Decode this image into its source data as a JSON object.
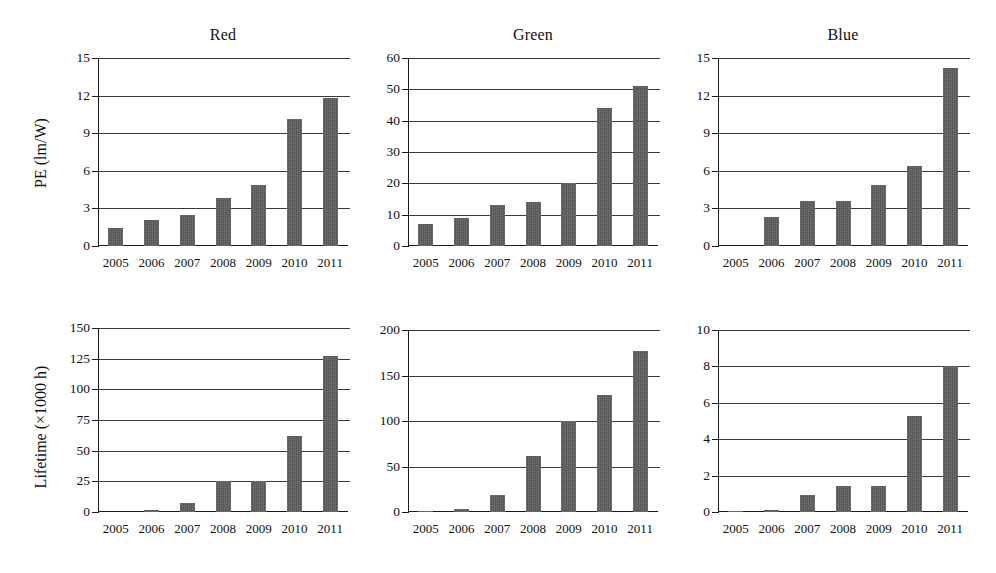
{
  "figure": {
    "width": 996,
    "height": 573,
    "bar_color": "#5c5c5c",
    "axis_color": "#1b1b1b",
    "grid_color": "#3a3a3a",
    "background": "#ffffff"
  },
  "axis_labels": {
    "pe": "PE (lm/W)",
    "lifetime": "Lifetime (×1000 h)"
  },
  "chart_data": [
    {
      "id": "red-pe",
      "type": "bar",
      "title": "Red",
      "xlabel": "",
      "ylabel": "PE (lm/W)",
      "categories": [
        "2005",
        "2006",
        "2007",
        "2008",
        "2009",
        "2010",
        "2011"
      ],
      "values": [
        1.4,
        2.1,
        2.5,
        3.8,
        4.85,
        10.1,
        11.8
      ],
      "ylim": [
        0,
        15
      ],
      "yticks": [
        0,
        3,
        6,
        9,
        12,
        15
      ],
      "ytick_labels": [
        "0",
        "3",
        "6",
        "9",
        "12",
        "15"
      ],
      "grid": true,
      "legend": "none"
    },
    {
      "id": "green-pe",
      "type": "bar",
      "title": "Green",
      "xlabel": "",
      "ylabel": "PE (lm/W)",
      "categories": [
        "2005",
        "2006",
        "2007",
        "2008",
        "2009",
        "2010",
        "2011"
      ],
      "values": [
        7,
        9,
        13,
        14,
        20,
        44,
        51
      ],
      "ylim": [
        0,
        60
      ],
      "yticks": [
        0,
        10,
        20,
        30,
        40,
        50,
        60
      ],
      "ytick_labels": [
        "0",
        "10",
        "20",
        "30",
        "40",
        "50",
        "60"
      ],
      "grid": true,
      "legend": "none"
    },
    {
      "id": "blue-pe",
      "type": "bar",
      "title": "Blue",
      "xlabel": "",
      "ylabel": "PE (lm/W)",
      "categories": [
        "2005",
        "2006",
        "2007",
        "2008",
        "2009",
        "2010",
        "2011"
      ],
      "values": [
        0,
        2.3,
        3.6,
        3.6,
        4.9,
        6.4,
        14.2
      ],
      "ylim": [
        0,
        15
      ],
      "yticks": [
        0,
        3,
        6,
        9,
        12,
        15
      ],
      "ytick_labels": [
        "0",
        "3",
        "6",
        "9",
        "12",
        "15"
      ],
      "grid": true,
      "legend": "none"
    },
    {
      "id": "red-lifetime",
      "type": "bar",
      "title": "",
      "xlabel": "",
      "ylabel": "Lifetime (×1000 h)",
      "categories": [
        "2005",
        "2006",
        "2007",
        "2008",
        "2009",
        "2010",
        "2011"
      ],
      "values": [
        0,
        2,
        7,
        25,
        25,
        62,
        127
      ],
      "ylim": [
        0,
        150
      ],
      "yticks": [
        0,
        25,
        50,
        75,
        100,
        125,
        150
      ],
      "ytick_labels": [
        "0",
        "25",
        "50",
        "75",
        "100",
        "125",
        "150"
      ],
      "grid": true,
      "legend": "none"
    },
    {
      "id": "green-lifetime",
      "type": "bar",
      "title": "",
      "xlabel": "",
      "ylabel": "",
      "categories": [
        "2005",
        "2006",
        "2007",
        "2008",
        "2009",
        "2010",
        "2011"
      ],
      "values": [
        1,
        3,
        19,
        62,
        100,
        129,
        177
      ],
      "ylim": [
        0,
        200
      ],
      "yticks": [
        0,
        50,
        100,
        150,
        200
      ],
      "ytick_labels": [
        "0",
        "50",
        "100",
        "150",
        "200"
      ],
      "grid": true,
      "legend": "none"
    },
    {
      "id": "blue-lifetime",
      "type": "bar",
      "title": "",
      "xlabel": "",
      "ylabel": "",
      "categories": [
        "2005",
        "2006",
        "2007",
        "2008",
        "2009",
        "2010",
        "2011"
      ],
      "values": [
        0.03,
        0.1,
        0.95,
        1.45,
        1.45,
        5.25,
        8
      ],
      "ylim": [
        0,
        10
      ],
      "yticks": [
        0,
        2,
        4,
        6,
        8,
        10
      ],
      "ytick_labels": [
        "0",
        "2",
        "4",
        "6",
        "8",
        "10"
      ],
      "grid": true,
      "legend": "none"
    }
  ],
  "panel_geometry": [
    {
      "id": "red-pe",
      "plot_left": 98,
      "plot_top": 58,
      "plot_width": 250,
      "plot_height": 188,
      "title_top": 26
    },
    {
      "id": "green-pe",
      "plot_left": 408,
      "plot_top": 58,
      "plot_width": 250,
      "plot_height": 188,
      "title_top": 26
    },
    {
      "id": "blue-pe",
      "plot_left": 718,
      "plot_top": 58,
      "plot_width": 250,
      "plot_height": 188,
      "title_top": 26
    },
    {
      "id": "red-lifetime",
      "plot_left": 98,
      "plot_top": 328,
      "plot_width": 250,
      "plot_height": 184,
      "title_top": 300
    },
    {
      "id": "green-lifetime",
      "plot_left": 408,
      "plot_top": 330,
      "plot_width": 250,
      "plot_height": 182,
      "title_top": 300
    },
    {
      "id": "blue-lifetime",
      "plot_left": 718,
      "plot_top": 330,
      "plot_width": 250,
      "plot_height": 182,
      "title_top": 300
    }
  ]
}
